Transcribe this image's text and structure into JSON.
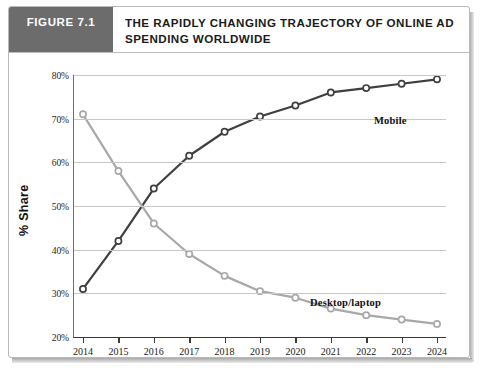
{
  "figure": {
    "badge_label": "FIGURE 7.1",
    "title": "THE RAPIDLY CHANGING TRAJECTORY OF ONLINE AD SPENDING WORLDWIDE",
    "badge_color": "#6c6c6c",
    "border_color": "#b9b9b9"
  },
  "chart_data": {
    "type": "line",
    "title": "THE RAPIDLY CHANGING TRAJECTORY OF ONLINE AD SPENDING WORLDWIDE",
    "xlabel": "",
    "ylabel": "% Share",
    "x": [
      "2014",
      "2015",
      "2016",
      "2017",
      "2018",
      "2019",
      "2020",
      "2021",
      "2022",
      "2023",
      "2024"
    ],
    "xtick_labels": [
      "2014",
      "2015",
      "2016",
      "2017",
      "2018",
      "2019",
      "2020",
      "2021",
      "2022",
      "2023",
      "2024"
    ],
    "ytick_labels": [
      "80%",
      "70%",
      "60%",
      "50%",
      "40%",
      "30%",
      "20%"
    ],
    "ytick_values": [
      80,
      70,
      60,
      50,
      40,
      30,
      20
    ],
    "ylim": [
      20,
      80
    ],
    "grid": true,
    "legend_position": "inline-annotation",
    "series": [
      {
        "name": "Mobile",
        "color": "#3f3f3f",
        "marker": "open-circle",
        "values": [
          31,
          42,
          54,
          61.5,
          67,
          70.5,
          73,
          76,
          77,
          78,
          79
        ]
      },
      {
        "name": "Desktop/laptop",
        "color": "#a8a8a8",
        "marker": "open-circle",
        "values": [
          71,
          58,
          46,
          39,
          34,
          30.5,
          29,
          26.5,
          25,
          24,
          23
        ]
      }
    ],
    "annotations": [
      {
        "text": "Mobile",
        "series": "Mobile"
      },
      {
        "text": "Desktop/laptop",
        "series": "Desktop/laptop"
      }
    ]
  }
}
